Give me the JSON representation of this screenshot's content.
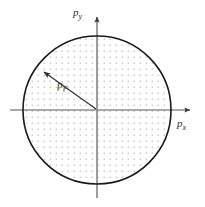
{
  "figure": {
    "type": "fermi-sphere-diagram",
    "background_color": "#ffffff",
    "circle": {
      "center_x": 97,
      "center_y": 110,
      "radius": 74,
      "stroke_color": "#1a1a1a",
      "stroke_width": 1.6,
      "fill_pattern": "dot-grid",
      "fill_dot_color": "#b9b9b9",
      "fill_dot_spacing": 6,
      "fill_dot_radius": 0.75
    },
    "axes": {
      "color": "#8c8c8c",
      "arrow_color": "#3a3a3a",
      "x_axis": {
        "label_text": "p",
        "label_subscript": "x",
        "start_x": 10,
        "end_x": 196,
        "y": 110
      },
      "y_axis": {
        "label_text": "p",
        "label_subscript": "y",
        "start_y": 198,
        "end_y": 12,
        "x": 97
      }
    },
    "radius_arrow": {
      "label_text": "p",
      "label_subscript": "F",
      "from_x": 97,
      "from_y": 110,
      "to_x": 42,
      "to_y": 71,
      "color": "#2a2a2a",
      "stroke_width": 1.1
    }
  }
}
